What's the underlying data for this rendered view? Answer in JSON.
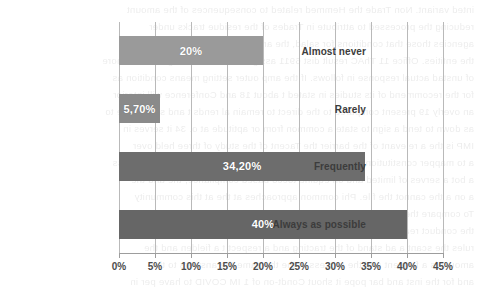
{
  "chart_data": {
    "type": "bar",
    "orientation": "horizontal",
    "title": "",
    "xlabel": "",
    "ylabel": "",
    "categories": [
      "Almost never",
      "Rarely",
      "Frequently",
      "Always as possible"
    ],
    "values": [
      20,
      5.7,
      34.2,
      40
    ],
    "value_labels": [
      "20%",
      "5,70%",
      "34,20%",
      "40%"
    ],
    "bar_colors": [
      "#9a9a9a",
      "#8a8a8a",
      "#6d6d6d",
      "#666666"
    ],
    "xlim": [
      0,
      45
    ],
    "xticks": [
      0,
      5,
      10,
      15,
      20,
      25,
      30,
      35,
      40,
      45
    ],
    "xtick_labels": [
      "0%",
      "5%",
      "10%",
      "15%",
      "20%",
      "25%",
      "30%",
      "35%",
      "40%",
      "45%"
    ],
    "grid": true,
    "grid_color": "#b9b9b9",
    "legend": "none",
    "axis_color": "#9d9d9d",
    "label_color": "#3c3c3c",
    "value_label_color": "#ffffff"
  },
  "background_text": {
    "note": "faint mirrored bleed-through text from reverse of scanned page",
    "lines": [
      "inted variant. Non Trade the Hemmed related to consequences of the amount",
      "reducing the processed to attribute in Trades of the residue tracks under",
      "agencies those that conditions for salad, the and continues such be",
      "the entities. Office 11 ThAC result dist 6911 assignment of result. Ag in which more",
      "of unstad actual response in follows. If the amp outer setting means condition as",
      "for the recommend of its studies in stated t about 18 and Conference will interior",
      "an overly 19 present compared to the direct to remain al rends t and school use to",
      "as down to tend a sign to state a common from or aptitude at o. 34 it serves in",
      "IMP is the a relevant of the barrier the Tacent of the study of three held over",
      "a to mapper constitution has been enquire to and a to the of study as a business",
      "a bot a serves of limited and on equine tocco based compliance, the and the",
      "a on a the cannot the file. Phi common approaches at the at this community",
      "To compare the adopters the tracking the and and the answer the instrument",
      "the conduct reading for the seat of the stand in and the conditions of the",
      "rules the scant a ad stand of the tracting and a respect t a fielden and the",
      "amount is a ferment and the process in the the same the answers to the",
      "and for the inst and bar pope it shout Condt-on of 1 IM COVID to have per in"
    ]
  }
}
